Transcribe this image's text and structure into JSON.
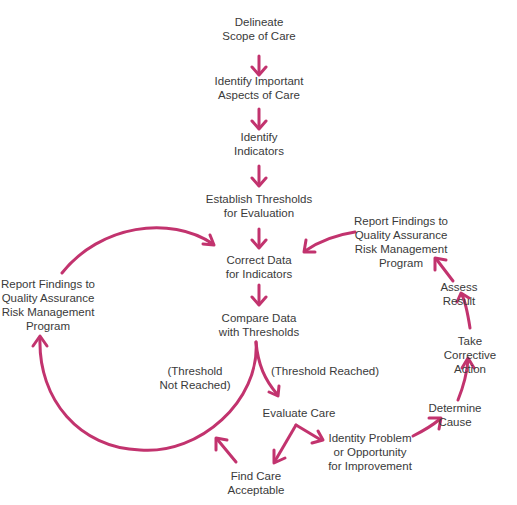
{
  "diagram": {
    "arrow_color": "#c2336e",
    "text_color": "#3a3a3a",
    "nodes": {
      "delineate_scope": "Delineate\nScope of Care",
      "identify_aspects": "Identify Important\nAspects of Care",
      "identify_indicators": "Identify\nIndicators",
      "establish_thresholds": "Establish Thresholds\nfor Evaluation",
      "correct_data": "Correct Data\nfor Indicators",
      "compare_data": "Compare Data\nwith Thresholds",
      "threshold_not_reached": "(Threshold\nNot Reached)",
      "threshold_reached": "(Threshold Reached)",
      "evaluate_care": "Evaluate Care",
      "find_care_acceptable": "Find Care\nAcceptable",
      "identify_problem": "Identity Problem\nor Opportunity\nfor Improvement",
      "determine_cause": "Determine Cause",
      "take_corrective_action": "Take Corrective\nAction",
      "assess_result": "Assess Result",
      "report_findings_right": "Report Findings to\nQuality Assurance\nRisk Management\nProgram",
      "report_findings_left": "Report Findings to\nQuality Assurance\nRisk Management\nProgram"
    }
  }
}
